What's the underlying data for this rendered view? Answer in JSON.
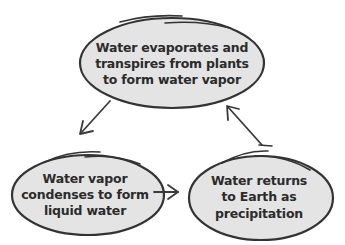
{
  "diagram": {
    "type": "cycle",
    "colors": {
      "node_fill": "#e4e4e4",
      "node_stroke": "#333333",
      "text": "#2b2b2b",
      "arrow": "#3a3a3a",
      "background": "#ffffff"
    },
    "nodes": [
      {
        "id": "evaporation",
        "lines": [
          "Water evaporates and",
          "transpires from plants",
          "to form water vapor"
        ]
      },
      {
        "id": "condensation",
        "lines": [
          "Water vapor",
          "condenses to form",
          "liquid water"
        ]
      },
      {
        "id": "precipitation",
        "lines": [
          "Water returns",
          "to Earth as",
          "precipitation"
        ]
      }
    ],
    "edges": [
      {
        "from": "evaporation",
        "to": "condensation"
      },
      {
        "from": "condensation",
        "to": "precipitation"
      },
      {
        "from": "precipitation",
        "to": "evaporation"
      }
    ]
  }
}
